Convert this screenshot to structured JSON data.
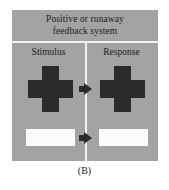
{
  "figure": {
    "caption": "(B)",
    "panel": {
      "title_lines": [
        "Positive or runaway",
        "feedback system"
      ],
      "columns": [
        {
          "heading": "Stimulus"
        },
        {
          "heading": "Response"
        }
      ],
      "rows": [
        {
          "name": "cross-row",
          "stimulus_shape": "cross",
          "response_shape": "cross",
          "arrow": "right-arrow"
        },
        {
          "name": "bar-row",
          "stimulus_shape": "white-rectangle",
          "response_shape": "white-rectangle",
          "arrow": "right-arrow"
        }
      ]
    },
    "colors": {
      "panel_background": "#a3a3a3",
      "shape_dark": "#2b2b2b",
      "shape_light": "#fbfbfb",
      "divider": "#f2f2f2",
      "text": "#1a1a1a",
      "page_background": "#ffffff"
    }
  }
}
